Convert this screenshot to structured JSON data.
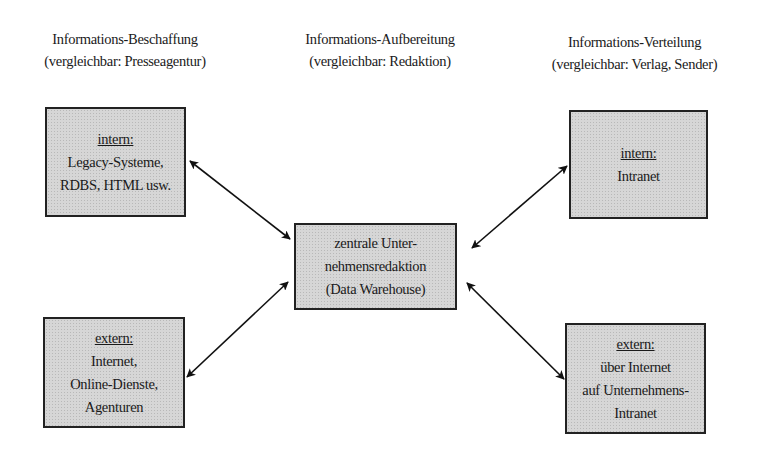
{
  "columns": [
    {
      "title": "Informations-Beschaffung",
      "subtitle": "(vergleichbar: Presseagentur)"
    },
    {
      "title": "Informations-Aufbereitung",
      "subtitle": "(vergleichbar: Redaktion)"
    },
    {
      "title": "Informations-Verteilung",
      "subtitle": "(vergleichbar: Verlag, Sender)"
    }
  ],
  "boxes": {
    "source_internal": {
      "heading": "intern:",
      "lines": [
        "Legacy-Systeme,",
        "RDBS, HTML usw."
      ]
    },
    "source_external": {
      "heading": "extern:",
      "lines": [
        "Internet,",
        "Online-Dienste,",
        "Agenturen"
      ]
    },
    "center": {
      "lines": [
        "zentrale Unter-",
        "nehmensredaktion",
        "(Data Warehouse)"
      ]
    },
    "dist_internal": {
      "heading": "intern:",
      "lines": [
        "Intranet"
      ]
    },
    "dist_external": {
      "heading": "extern:",
      "lines": [
        "über Internet",
        "auf Unternehmens-",
        "Intranet"
      ]
    }
  },
  "connections": [
    {
      "from": "source_internal",
      "to": "center",
      "direction": "bidirectional"
    },
    {
      "from": "source_external",
      "to": "center",
      "direction": "bidirectional"
    },
    {
      "from": "center",
      "to": "dist_internal",
      "direction": "bidirectional"
    },
    {
      "from": "center",
      "to": "dist_external",
      "direction": "bidirectional"
    }
  ]
}
